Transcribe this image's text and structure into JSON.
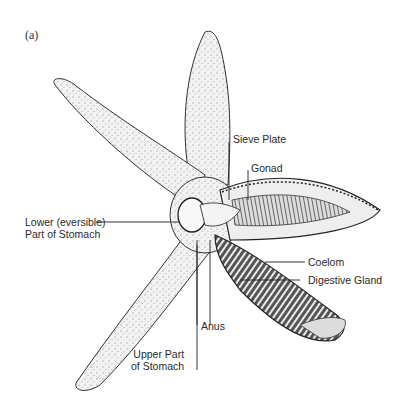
{
  "figure": {
    "panel_label": "(a)",
    "labels": {
      "sieve_plate": "Sieve Plate",
      "gonad": "Gonad",
      "lower_stomach_line1": "Lower (eversible)",
      "lower_stomach_line2": "Part of Stomach",
      "coelom": "Coelom",
      "digestive_gland": "Digestive Gland",
      "anus": "Anus",
      "upper_stomach_line1": "Upper Part",
      "upper_stomach_line2": "of Stomach"
    },
    "colors": {
      "ink": "#1a1a1a",
      "background": "#ffffff"
    }
  }
}
